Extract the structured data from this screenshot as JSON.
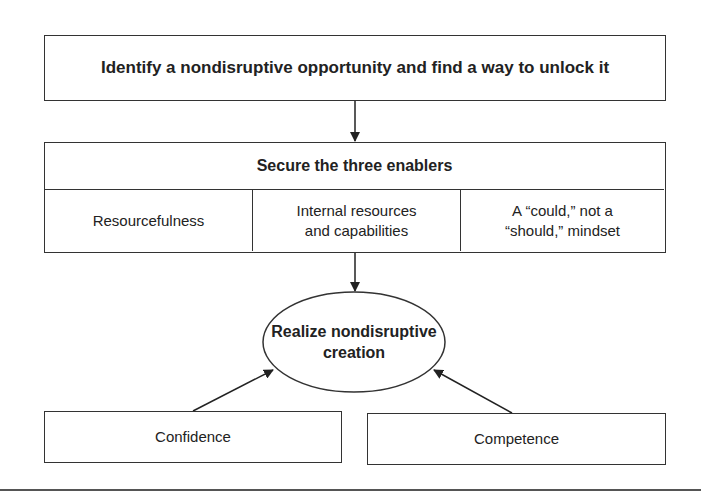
{
  "diagram": {
    "step1": "Identify a nondisruptive opportunity and find a way to unlock it",
    "step2": {
      "title": "Secure the three enablers",
      "enablers": [
        "Resourcefulness",
        "Internal resources and capabilities",
        "A “could,” not a “should,” mindset"
      ]
    },
    "outcome": "Realize nondisruptive creation",
    "supports": [
      "Confidence",
      "Competence"
    ],
    "colors": {
      "line": "#333333",
      "background": "#ffffff"
    }
  }
}
